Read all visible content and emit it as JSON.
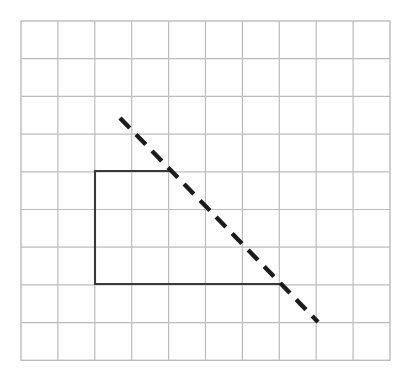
{
  "figure": {
    "canvas": {
      "width": 408,
      "height": 376,
      "background": "#ffffff"
    },
    "grid": {
      "name": "square-grid",
      "origin_x": 21,
      "origin_y": 21,
      "cols": 10,
      "rows": 9,
      "cell_width": 36.9,
      "cell_height": 37.7,
      "line_color": "#bcbcbc",
      "line_width": 1.2,
      "border_color": "#bcbcbc",
      "border_width": 1.4
    },
    "shapes": [
      {
        "name": "open-rectangle-path",
        "type": "polyline",
        "style": "solid",
        "stroke": "#3a3a3a",
        "stroke_width": 2.1,
        "points": [
          {
            "x": 169,
            "y": 171
          },
          {
            "x": 95,
            "y": 171
          },
          {
            "x": 95,
            "y": 284
          },
          {
            "x": 281,
            "y": 284
          }
        ],
        "grid_points": [
          {
            "col": 4,
            "row": 4
          },
          {
            "col": 2,
            "row": 4
          },
          {
            "col": 2,
            "row": 7
          },
          {
            "col": 7,
            "row": 7
          }
        ]
      },
      {
        "name": "dashed-diagonal-line",
        "type": "line",
        "style": "dashed",
        "stroke": "#1c1c1c",
        "stroke_width": 4.4,
        "dash_length": 14,
        "gap_length": 9,
        "start": {
          "x": 120,
          "y": 118
        },
        "end": {
          "x": 318,
          "y": 322
        },
        "slope": -1.03
      }
    ]
  },
  "chart_data": {
    "type": "scatter",
    "title": "",
    "xlabel": "",
    "ylabel": "",
    "grid": true,
    "xlim": [
      0,
      10
    ],
    "ylim": [
      0,
      9
    ],
    "series": [
      {
        "name": "open-rectangle-path",
        "style": "solid",
        "color": "#3a3a3a",
        "x": [
          4,
          2,
          2,
          7
        ],
        "y": [
          5,
          5,
          2,
          2
        ]
      },
      {
        "name": "dashed-diagonal-line",
        "style": "dashed",
        "color": "#1c1c1c",
        "x": [
          2.68,
          8.05
        ],
        "y": [
          6.43,
          0.98
        ]
      }
    ]
  }
}
